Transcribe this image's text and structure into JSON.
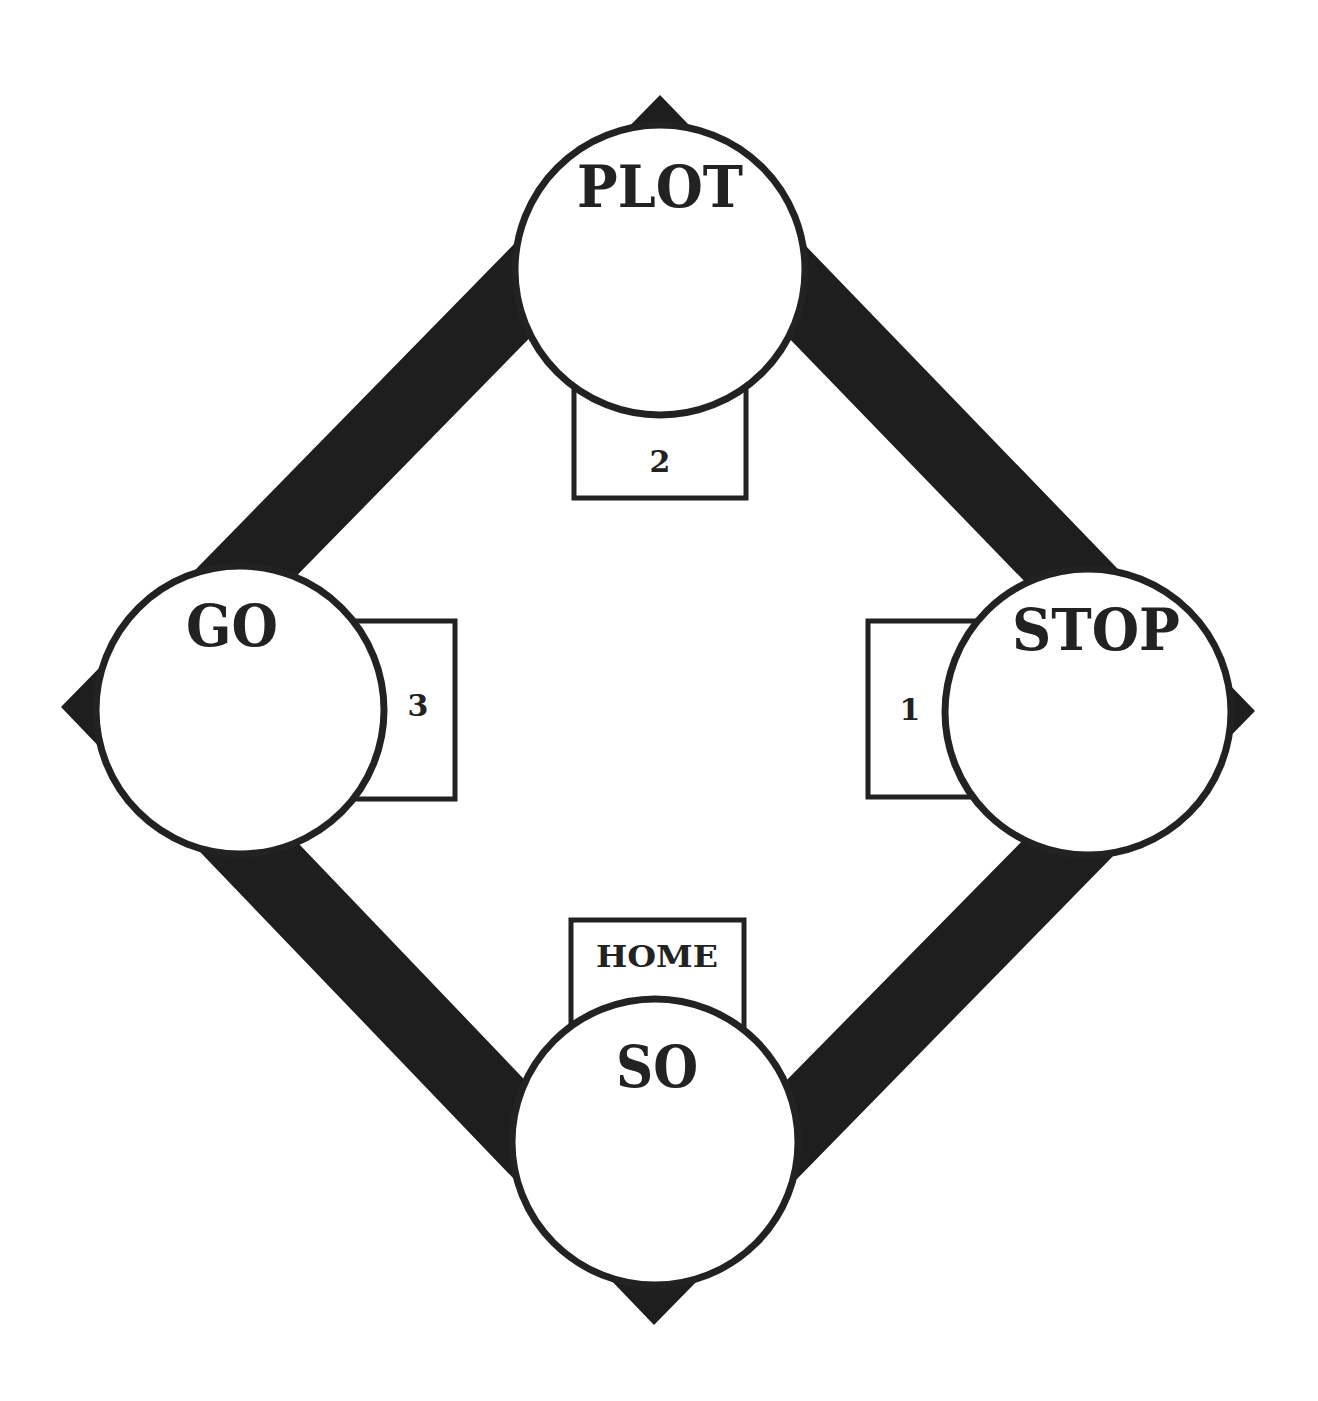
{
  "diagram": {
    "title": "",
    "colors": {
      "band": "#1e1e1e",
      "stroke": "#222222",
      "fill": "#ffffff"
    },
    "stations": [
      {
        "id": "plot",
        "label": "PLOT",
        "position": "top"
      },
      {
        "id": "stop",
        "label": "STOP",
        "position": "right"
      },
      {
        "id": "so",
        "label": "SO",
        "position": "bottom"
      },
      {
        "id": "go",
        "label": "GO",
        "position": "left"
      }
    ],
    "boxes": [
      {
        "id": "box-1",
        "label": "1",
        "attached_to": "STOP"
      },
      {
        "id": "box-2",
        "label": "2",
        "attached_to": "PLOT"
      },
      {
        "id": "box-3",
        "label": "3",
        "attached_to": "GO"
      },
      {
        "id": "box-home",
        "label": "HOME",
        "attached_to": "SO"
      }
    ],
    "path_order": [
      "HOME",
      "1",
      "2",
      "3"
    ]
  }
}
